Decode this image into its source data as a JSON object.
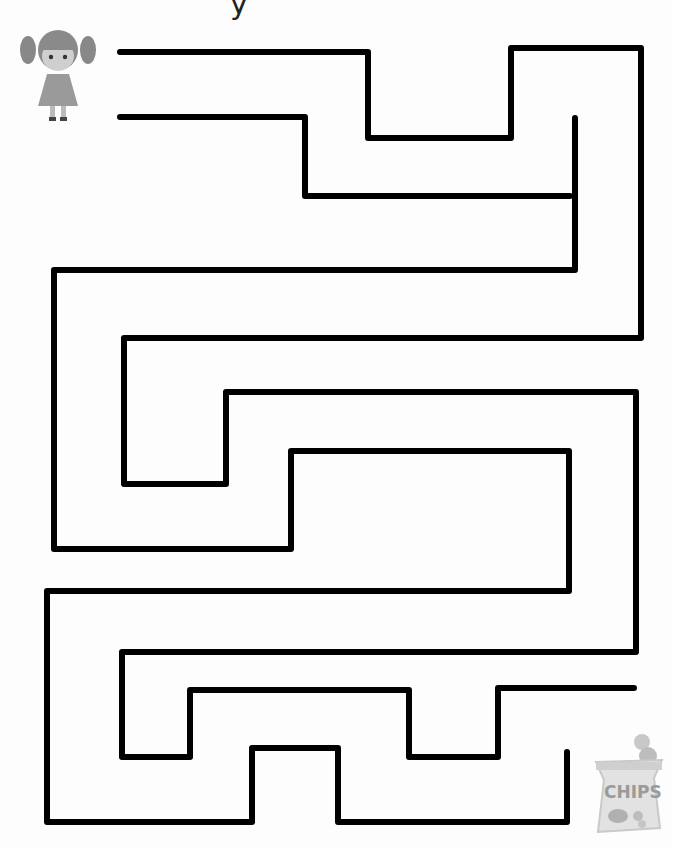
{
  "worksheet": {
    "title_fragment": "y",
    "type": "maze",
    "start": {
      "icon": "girl-icon",
      "label": "girl character"
    },
    "finish": {
      "icon": "chips-bag-icon",
      "label": "CHIPS"
    }
  },
  "colors": {
    "walls": "#000000",
    "background": "#fdfdfd",
    "illustration": "#9a9a9a"
  }
}
